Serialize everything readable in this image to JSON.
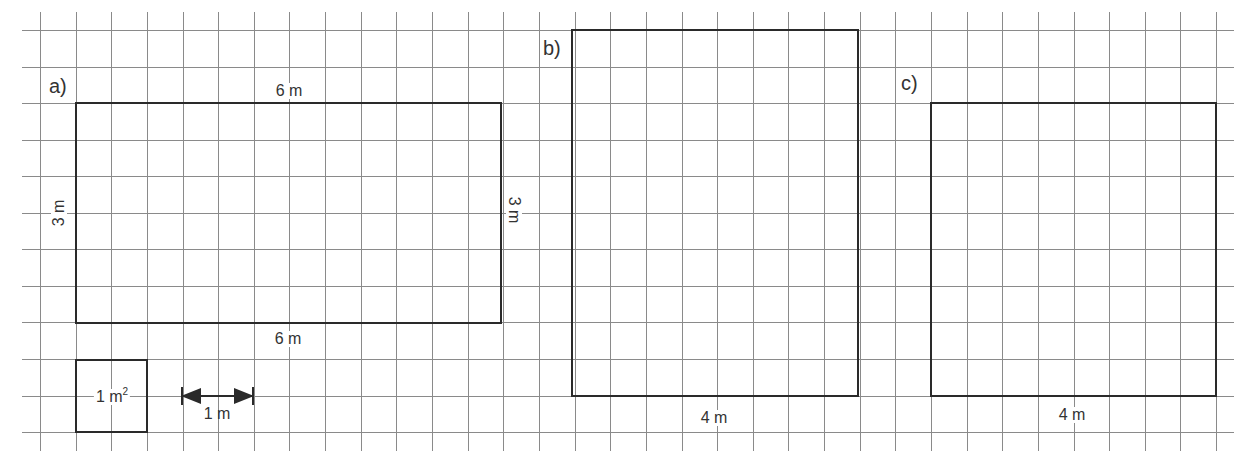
{
  "grid": {
    "x_start": 40,
    "x_step": 35.64,
    "x_count": 34,
    "y_start": 30,
    "y_step": 36.55,
    "y_count": 12,
    "h_line_from": 22,
    "h_line_to": 1234,
    "v_line_from": 12,
    "v_line_to": 451,
    "color": "#8a8a8a"
  },
  "figures": {
    "a": {
      "label": "a)",
      "rect": {
        "x": 76,
        "y": 103,
        "w": 425,
        "h": 220
      },
      "top_dim": "6 m",
      "bottom_dim": "6 m",
      "left_dim": "3 m",
      "right_dim": "3 m"
    },
    "b": {
      "label": "b)",
      "rect": {
        "x": 572,
        "y": 30,
        "w": 286,
        "h": 366
      },
      "bottom_dim": "4 m"
    },
    "c": {
      "label": "c)",
      "rect": {
        "x": 931,
        "y": 103,
        "w": 285,
        "h": 293
      },
      "bottom_dim": "4 m"
    }
  },
  "legend": {
    "unit_square": {
      "rect": {
        "x": 76,
        "y": 360,
        "w": 71,
        "h": 72
      },
      "label_value": "1 m",
      "label_exp": "2"
    },
    "unit_length": {
      "x1": 182,
      "x2": 253,
      "y": 396,
      "label": "1 m"
    }
  },
  "colors": {
    "stroke": "#2a2a2a",
    "text": "#333333",
    "background": "#ffffff"
  }
}
